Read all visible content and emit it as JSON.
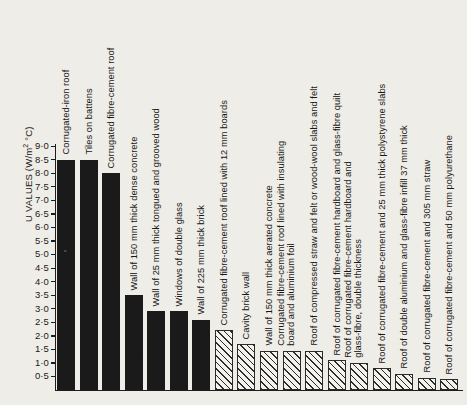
{
  "chart_data": {
    "type": "bar",
    "title": "",
    "xlabel": "",
    "ylabel": "U VALUES (W/m2 °C)",
    "ylabel_parts": {
      "pre": "U VALUES (W/m",
      "sup": "2",
      "post": " °C)"
    },
    "ylim": [
      0,
      9.0
    ],
    "ytick_labels": [
      "9·0",
      "8·5",
      "8·0",
      "7·5",
      "7·0",
      "6·5",
      "6·0",
      "5·5",
      "5·0",
      "4·5",
      "4·0",
      "3·5",
      "3·0",
      "2·5",
      "2·0",
      "1·5",
      "1·0",
      "0·5"
    ],
    "ytick_values": [
      9.0,
      8.5,
      8.0,
      7.5,
      7.0,
      6.5,
      6.0,
      5.5,
      5.0,
      4.5,
      4.0,
      3.5,
      3.0,
      2.5,
      2.0,
      1.5,
      1.0,
      0.5
    ],
    "grid": false,
    "legend": "none",
    "bar_styles": {
      "solid": "#1a1a1a",
      "hatched": "diagonal-hatch"
    },
    "categories": [
      "Corrugated-iron roof",
      "Tiles on battens",
      "Corrugated fibre-cement roof",
      "Wall of 150 mm thick dense concrete",
      "Wall of 25 mm thick tongued and grooved wood",
      "Windows of double glass",
      "Wall of 225 mm thick brick",
      "Corrugated fibre-cement roof lined with 12 mm boards",
      "Cavity brick wall",
      "Wall of 150 mm thick aerated concrete",
      "Corrugated fibre-cement roof lined with insulating board and aluminium foil",
      "Roof of compressed straw and felt or wood-wool slabs and felt",
      "Roof of corrugated fibre-cement hardboard and glass-fibre quilt",
      "Roof of corrugated fibre-cement hardboard and glass-fibre, double thickness",
      "Roof of corrugated fibre-cement and 25 mm thick polystyrene slabs",
      "Roof of double aluminium and glass-fibre infill 37 mm thick",
      "Roof of corrugated fibre-cement and 305 mm straw",
      "Roof of corrugated fibre-cement and 50 mm polyurethane"
    ],
    "values": [
      8.5,
      8.5,
      8.0,
      3.5,
      2.9,
      2.9,
      2.6,
      2.2,
      1.7,
      1.45,
      1.45,
      1.45,
      1.1,
      1.0,
      0.8,
      0.6,
      0.45,
      0.4
    ],
    "fills": [
      "solid",
      "solid",
      "solid",
      "solid",
      "solid",
      "solid",
      "solid",
      "hatched",
      "hatched",
      "hatched",
      "hatched",
      "hatched",
      "hatched",
      "hatched",
      "hatched",
      "hatched",
      "hatched",
      "hatched"
    ]
  }
}
